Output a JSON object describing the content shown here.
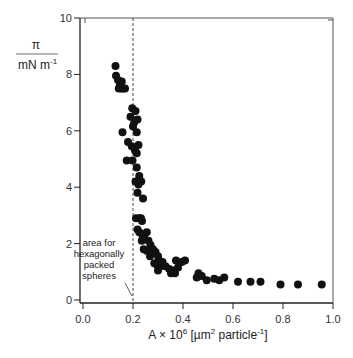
{
  "chart_data": {
    "type": "scatter",
    "title": "",
    "xlabel": {
      "prefix": "A × 10",
      "prefix_sup": "6",
      "unit_open": " [µm",
      "unit_sup": "2",
      "unit_mid": " particle",
      "unit_sup2": "-1",
      "unit_close": "]"
    },
    "ylabel": {
      "numerator": "π",
      "denominator": "mN m",
      "denominator_sup": "-1"
    },
    "xlim": [
      0.0,
      1.0
    ],
    "ylim": [
      0,
      10
    ],
    "xticks": [
      0.0,
      0.2,
      0.4,
      0.6,
      0.8,
      1.0
    ],
    "xtick_labels": [
      "0.0",
      "0.2",
      "0.4",
      "0.6",
      "0.8",
      "1.0"
    ],
    "yticks": [
      0,
      2,
      4,
      6,
      8,
      10
    ],
    "ytick_labels": [
      "0",
      "2",
      "4",
      "6",
      "8",
      "10"
    ],
    "grid": false,
    "legend": null,
    "reference_line": {
      "x": 0.2,
      "style": "dashed"
    },
    "annotation": {
      "lines": [
        "area for",
        "hexagonally",
        "packed",
        "spheres"
      ],
      "points_to_x": 0.2
    },
    "marker_color": "#111111",
    "series": [
      {
        "name": "surface pressure isotherm",
        "points": [
          [
            0.13,
            8.3
          ],
          [
            0.132,
            7.95
          ],
          [
            0.14,
            7.8
          ],
          [
            0.148,
            7.65
          ],
          [
            0.155,
            7.75
          ],
          [
            0.143,
            7.5
          ],
          [
            0.152,
            7.5
          ],
          [
            0.16,
            7.5
          ],
          [
            0.168,
            7.5
          ],
          [
            0.197,
            6.8
          ],
          [
            0.21,
            6.7
          ],
          [
            0.19,
            6.5
          ],
          [
            0.205,
            6.3
          ],
          [
            0.218,
            6.4
          ],
          [
            0.2,
            6.15
          ],
          [
            0.215,
            5.95
          ],
          [
            0.158,
            5.95
          ],
          [
            0.18,
            5.6
          ],
          [
            0.195,
            5.45
          ],
          [
            0.208,
            5.3
          ],
          [
            0.222,
            5.5
          ],
          [
            0.215,
            5.2
          ],
          [
            0.175,
            4.95
          ],
          [
            0.198,
            4.95
          ],
          [
            0.215,
            4.7
          ],
          [
            0.21,
            4.2
          ],
          [
            0.225,
            4.4
          ],
          [
            0.233,
            4.2
          ],
          [
            0.222,
            4.1
          ],
          [
            0.218,
            3.8
          ],
          [
            0.24,
            3.6
          ],
          [
            0.212,
            2.9
          ],
          [
            0.225,
            2.9
          ],
          [
            0.232,
            2.9
          ],
          [
            0.236,
            2.8
          ],
          [
            0.218,
            2.5
          ],
          [
            0.225,
            2.4
          ],
          [
            0.238,
            2.3
          ],
          [
            0.255,
            2.4
          ],
          [
            0.245,
            2.2
          ],
          [
            0.235,
            2.1
          ],
          [
            0.262,
            2.1
          ],
          [
            0.27,
            1.95
          ],
          [
            0.243,
            1.8
          ],
          [
            0.255,
            1.75
          ],
          [
            0.28,
            1.8
          ],
          [
            0.29,
            1.7
          ],
          [
            0.268,
            1.55
          ],
          [
            0.3,
            1.55
          ],
          [
            0.305,
            1.4
          ],
          [
            0.285,
            1.3
          ],
          [
            0.295,
            1.25
          ],
          [
            0.318,
            1.35
          ],
          [
            0.31,
            1.2
          ],
          [
            0.33,
            1.2
          ],
          [
            0.3,
            1.05
          ],
          [
            0.345,
            1.1
          ],
          [
            0.36,
            1.05
          ],
          [
            0.352,
            0.95
          ],
          [
            0.368,
            0.95
          ],
          [
            0.38,
            1.15
          ],
          [
            0.395,
            1.35
          ],
          [
            0.372,
            1.4
          ],
          [
            0.408,
            1.4
          ],
          [
            0.455,
            0.8
          ],
          [
            0.462,
            0.95
          ],
          [
            0.475,
            0.85
          ],
          [
            0.495,
            0.7
          ],
          [
            0.525,
            0.75
          ],
          [
            0.545,
            0.7
          ],
          [
            0.565,
            0.8
          ],
          [
            0.62,
            0.65
          ],
          [
            0.67,
            0.65
          ],
          [
            0.71,
            0.65
          ],
          [
            0.79,
            0.55
          ],
          [
            0.86,
            0.55
          ],
          [
            0.955,
            0.55
          ]
        ]
      }
    ]
  }
}
